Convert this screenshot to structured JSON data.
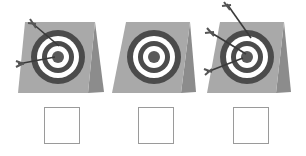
{
  "figure": {
    "colors": {
      "board_face": "#a9a9a9",
      "board_side": "#8c8c8c",
      "ring_dark": "#4b4b4b",
      "ring_light": "#ffffff",
      "bullseye": "#5a5a5a",
      "arrow_shaft": "#3a3a3a",
      "box_border": "#9a9a9a"
    },
    "targets": [
      {
        "id": "target-1",
        "arrow_count": 2,
        "arrows": [
          {
            "tail": [
              32,
              23
            ],
            "tip": [
              59,
              46
            ]
          },
          {
            "tail": [
              18,
              64
            ],
            "tip": [
              55,
              57
            ]
          }
        ],
        "answer_box": {
          "value": ""
        }
      },
      {
        "id": "target-2",
        "arrow_count": 0,
        "arrows": [],
        "answer_box": {
          "value": ""
        }
      },
      {
        "id": "target-3",
        "arrow_count": 3,
        "arrows": [
          {
            "tail": [
              227,
              4
            ],
            "tip": [
              251,
              38
            ]
          },
          {
            "tail": [
              210,
              32
            ],
            "tip": [
              246,
              54
            ]
          },
          {
            "tail": [
              207,
              72
            ],
            "tip": [
              243,
              58
            ]
          }
        ],
        "answer_box": {
          "value": ""
        }
      }
    ]
  }
}
